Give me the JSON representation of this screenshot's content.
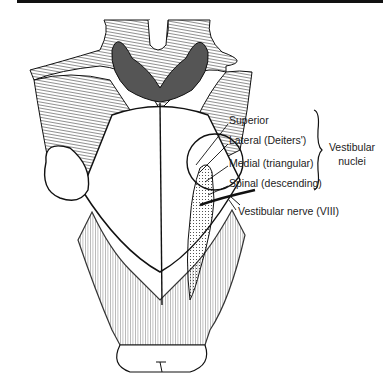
{
  "figure": {
    "labels": {
      "superior": "Superior",
      "lateral": "Lateral (Deiters')",
      "medial": "Medial (triangular)",
      "spinal": "Spinal (descending)",
      "nerve": "Vestibular nerve (VIII)"
    },
    "group_label": {
      "line1": "Vestibular",
      "line2": "nuclei"
    }
  },
  "colors": {
    "line": "#111111",
    "background": "#ffffff"
  }
}
